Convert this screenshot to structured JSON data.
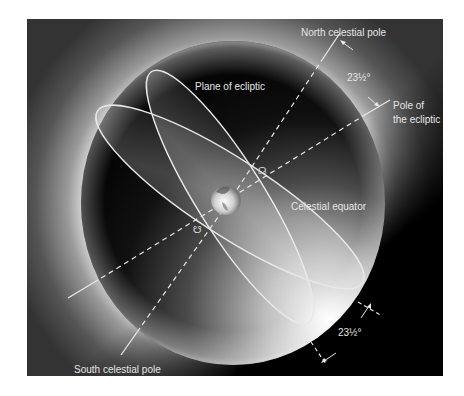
{
  "diagram": {
    "colors": {
      "frame_background": "#3a3a3a",
      "sphere_dark": "#0a0a0a",
      "sphere_highlight": "#d9d9d9",
      "line_color": "#e8e8e8",
      "label_color": "#e6e6e6"
    },
    "labels": {
      "north_celestial_pole": "North celestial pole",
      "south_celestial_pole": "South celestial pole",
      "pole_of_ecliptic_line1": "Pole of",
      "pole_of_ecliptic_line2": "the ecliptic",
      "plane_of_ecliptic": "Plane of ecliptic",
      "celestial_equator": "Celestial equator",
      "angle_top": "23½°",
      "angle_bottom": "23½°"
    },
    "symbols": {
      "ascending_node": "☊",
      "descending_node": "☋"
    },
    "angles": {
      "obliquity_degrees": 23.5
    }
  }
}
